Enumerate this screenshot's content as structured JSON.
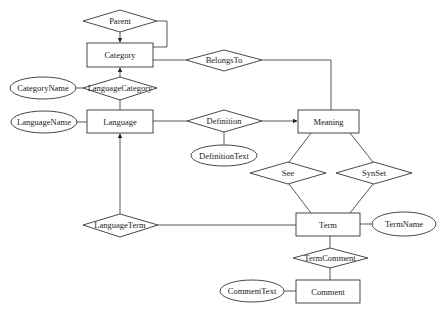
{
  "diagram": {
    "type": "entity-relationship",
    "entities": [
      {
        "id": "category",
        "label": "Category",
        "x": 87,
        "y": 43,
        "w": 66,
        "h": 24
      },
      {
        "id": "language",
        "label": "Language",
        "x": 87,
        "y": 110,
        "w": 66,
        "h": 23
      },
      {
        "id": "meaning",
        "label": "Meaning",
        "x": 298,
        "y": 110,
        "w": 61,
        "h": 23
      },
      {
        "id": "term",
        "label": "Term",
        "x": 296,
        "y": 213,
        "w": 64,
        "h": 23
      },
      {
        "id": "comment",
        "label": "Comment",
        "x": 296,
        "y": 280,
        "w": 64,
        "h": 23
      }
    ],
    "relationships": [
      {
        "id": "parent",
        "label": "Parent",
        "cx": 120,
        "cy": 21,
        "w": 74,
        "h": 22
      },
      {
        "id": "language_category",
        "label": "LanguageCategory",
        "cx": 120,
        "cy": 88,
        "w": 74,
        "h": 23
      },
      {
        "id": "belongs_to",
        "label": "BelongsTo",
        "cx": 224,
        "cy": 60,
        "w": 76,
        "h": 21
      },
      {
        "id": "definition",
        "label": "Definition",
        "cx": 224,
        "cy": 121,
        "w": 75,
        "h": 22
      },
      {
        "id": "see",
        "label": "See",
        "cx": 288,
        "cy": 173,
        "w": 76,
        "h": 22
      },
      {
        "id": "synset",
        "label": "SynSet",
        "cx": 374,
        "cy": 173,
        "w": 76,
        "h": 22
      },
      {
        "id": "language_term",
        "label": "LanguageTerm",
        "cx": 120,
        "cy": 225,
        "w": 75,
        "h": 23
      },
      {
        "id": "term_comment",
        "label": "TermComment",
        "cx": 330,
        "cy": 258,
        "w": 75,
        "h": 20
      }
    ],
    "attributes": [
      {
        "id": "category_name",
        "label": "CategoryName",
        "cx": 43,
        "cy": 88,
        "rx": 33,
        "ry": 11
      },
      {
        "id": "language_name",
        "label": "LanguageName",
        "cx": 44,
        "cy": 122,
        "rx": 33,
        "ry": 11
      },
      {
        "id": "definition_text",
        "label": "DefinitionText",
        "cx": 224,
        "cy": 155,
        "rx": 33,
        "ry": 10.5
      },
      {
        "id": "term_name",
        "label": "TermName",
        "cx": 404,
        "cy": 224,
        "rx": 32,
        "ry": 12
      },
      {
        "id": "comment_text",
        "label": "CommentText",
        "cx": 252,
        "cy": 291,
        "rx": 32,
        "ry": 11
      }
    ]
  }
}
